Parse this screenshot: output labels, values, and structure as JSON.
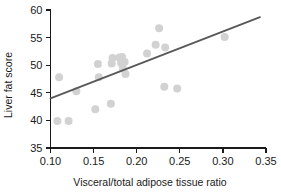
{
  "chart_data": {
    "type": "scatter",
    "title": "",
    "subtitle": "",
    "xlabel": "Visceral/total adipose tissue ratio",
    "ylabel": "Liver fat score",
    "xlim": [
      0.1,
      0.35
    ],
    "ylim": [
      35,
      60
    ],
    "xticks": [
      0.1,
      0.15,
      0.2,
      0.25,
      0.3,
      0.35
    ],
    "xticklabels": [
      "0.10",
      "0.15",
      "0.20",
      "0.25",
      "0.30",
      "0.35"
    ],
    "yticks": [
      35,
      40,
      45,
      50,
      55,
      60
    ],
    "yticklabels": [
      "35",
      "40",
      "45",
      "50",
      "55",
      "60"
    ],
    "grid": false,
    "legend": null,
    "marker_color": "#d2d2d2",
    "marker_radius": 4.0,
    "line_color": "#58585a",
    "axis_color": "#1a1a1a",
    "background_color": "#ffffff",
    "points": [
      {
        "x": 0.108,
        "y": 39.9
      },
      {
        "x": 0.11,
        "y": 47.8
      },
      {
        "x": 0.121,
        "y": 39.9
      },
      {
        "x": 0.13,
        "y": 45.3
      },
      {
        "x": 0.152,
        "y": 42.0
      },
      {
        "x": 0.155,
        "y": 50.2
      },
      {
        "x": 0.156,
        "y": 47.8
      },
      {
        "x": 0.17,
        "y": 43.0
      },
      {
        "x": 0.171,
        "y": 50.3
      },
      {
        "x": 0.172,
        "y": 51.3
      },
      {
        "x": 0.18,
        "y": 51.4
      },
      {
        "x": 0.182,
        "y": 50.4
      },
      {
        "x": 0.183,
        "y": 51.5
      },
      {
        "x": 0.184,
        "y": 49.4
      },
      {
        "x": 0.186,
        "y": 50.6
      },
      {
        "x": 0.187,
        "y": 48.4
      },
      {
        "x": 0.212,
        "y": 52.1
      },
      {
        "x": 0.222,
        "y": 53.7
      },
      {
        "x": 0.226,
        "y": 56.7
      },
      {
        "x": 0.232,
        "y": 46.1
      },
      {
        "x": 0.233,
        "y": 53.2
      },
      {
        "x": 0.247,
        "y": 45.8
      },
      {
        "x": 0.302,
        "y": 55.1
      }
    ],
    "trend_line": {
      "type": "linear-fit",
      "x_start": 0.1,
      "y_start": 44.0,
      "x_end": 0.343,
      "y_end": 58.7,
      "slope": 60.5,
      "intercept": 37.95
    }
  }
}
